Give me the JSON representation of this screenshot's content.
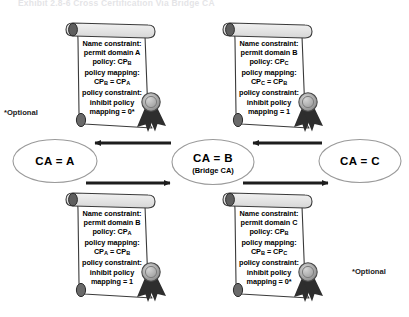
{
  "figure": {
    "title": "Exhibit 2.8-6   Cross Certification Via Bridge CA"
  },
  "nodes": [
    {
      "id": "ca-a",
      "label": "CA = A",
      "sublabel": ""
    },
    {
      "id": "ca-b",
      "label": "CA = B",
      "sublabel": "(Bridge CA)"
    },
    {
      "id": "ca-c",
      "label": "CA = C",
      "sublabel": ""
    }
  ],
  "certificates": {
    "top_left": {
      "line1": "Name constraint:",
      "line2": "permit domain A",
      "line3_prefix": "policy: CP",
      "line3_sub": "B",
      "line4": "policy mapping:",
      "line5_a": "CP",
      "line5_a_sub": "B",
      "line5_eq": " = CP",
      "line5_b_sub": "A",
      "line6": "policy constraint:",
      "line7": "inhibit policy",
      "line8": "mapping = 0*"
    },
    "top_right": {
      "line1": "Name constraint:",
      "line2": "permit domain B",
      "line3_prefix": "policy: CP",
      "line3_sub": "C",
      "line4": "policy mapping:",
      "line5_a": "CP",
      "line5_a_sub": "C",
      "line5_eq": " = CP",
      "line5_b_sub": "B",
      "line6": "policy constraint:",
      "line7": "inhibit policy",
      "line8": "mapping = 1"
    },
    "bottom_left": {
      "line1": "Name constraint:",
      "line2": "permit domain B",
      "line3_prefix": "policy: CP",
      "line3_sub": "A",
      "line4": "policy mapping:",
      "line5_a": "CP",
      "line5_a_sub": "A",
      "line5_eq": " = CP",
      "line5_b_sub": "B",
      "line6": "policy constraint:",
      "line7": "inhibit policy",
      "line8": "mapping = 1"
    },
    "bottom_right": {
      "line1": "Name constraint:",
      "line2": "permit domain C",
      "line3_prefix": "policy: CP",
      "line3_sub": "B",
      "line4": "policy mapping:",
      "line5_a": "CP",
      "line5_a_sub": "B",
      "line5_eq": " = CP",
      "line5_b_sub": "C",
      "line6": "policy constraint:",
      "line7": "inhibit policy",
      "line8": "mapping = 0*"
    }
  },
  "annotations": {
    "optional_left": "*Optional",
    "optional_right": "*Optional"
  },
  "arrows": [
    {
      "id": "arrow-b-to-a",
      "direction": "left",
      "from": "CA = B",
      "to": "CA = A"
    },
    {
      "id": "arrow-c-to-b",
      "direction": "left",
      "from": "CA = C",
      "to": "CA = B"
    },
    {
      "id": "arrow-a-to-b",
      "direction": "right",
      "from": "CA = A",
      "to": "CA = B"
    },
    {
      "id": "arrow-b-to-c",
      "direction": "right",
      "from": "CA = B",
      "to": "CA = C"
    }
  ],
  "colors": {
    "stroke": "#2b2b2b",
    "paper": "#ffffff",
    "seal_fill": "#9a9a9a",
    "ribbon": "#2e2e2e",
    "ellipse_stroke": "#8d8d8d"
  }
}
